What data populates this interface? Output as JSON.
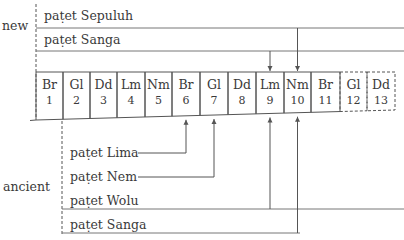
{
  "sides": {
    "new": "new",
    "ancient": "ancient"
  },
  "new_pathet": [
    {
      "label": "paṭet Sepuluh",
      "target_index": 10
    },
    {
      "label": "paṭet Sanga",
      "target_index": 9
    }
  ],
  "ancient_pathet": [
    {
      "label": "paṭet Lima",
      "target_index": 6
    },
    {
      "label": "paṭet Nem",
      "target_index": 7
    },
    {
      "label": "paṭet Wolu",
      "target_index": 9
    },
    {
      "label": "paṭet Sanga",
      "target_index": 10
    }
  ],
  "cells": [
    {
      "name": "Br",
      "num": "1",
      "dashed": false
    },
    {
      "name": "Gl",
      "num": "2",
      "dashed": false
    },
    {
      "name": "Dd",
      "num": "3",
      "dashed": false
    },
    {
      "name": "Lm",
      "num": "4",
      "dashed": false
    },
    {
      "name": "Nm",
      "num": "5",
      "dashed": false
    },
    {
      "name": "Br",
      "num": "6",
      "dashed": false
    },
    {
      "name": "Gl",
      "num": "7",
      "dashed": false
    },
    {
      "name": "Dd",
      "num": "8",
      "dashed": false
    },
    {
      "name": "Lm",
      "num": "9",
      "dashed": false
    },
    {
      "name": "Nm",
      "num": "10",
      "dashed": false
    },
    {
      "name": "Br",
      "num": "11",
      "dashed": false
    },
    {
      "name": "Gl",
      "num": "12",
      "dashed": true
    },
    {
      "name": "Dd",
      "num": "13",
      "dashed": true
    }
  ],
  "colors": {
    "line": "#555555",
    "text": "#3a3a3a"
  }
}
